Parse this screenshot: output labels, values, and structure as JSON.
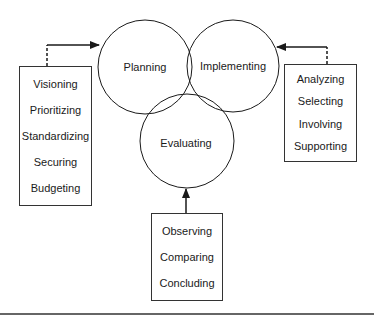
{
  "diagram": {
    "circles": [
      {
        "id": "planning",
        "label": "Planning"
      },
      {
        "id": "implementing",
        "label": "Implementing"
      },
      {
        "id": "evaluating",
        "label": "Evaluating"
      }
    ],
    "boxes": {
      "planning_activities": [
        "Visioning",
        "Prioritizing",
        "Standardizing",
        "Securing",
        "Budgeting"
      ],
      "implementing_activities": [
        "Analyzing",
        "Selecting",
        "Involving",
        "Supporting"
      ],
      "evaluating_activities": [
        "Observing",
        "Comparing",
        "Concluding"
      ]
    },
    "colors": {
      "line": "#1a1a1a",
      "background": "#ffffff"
    }
  }
}
